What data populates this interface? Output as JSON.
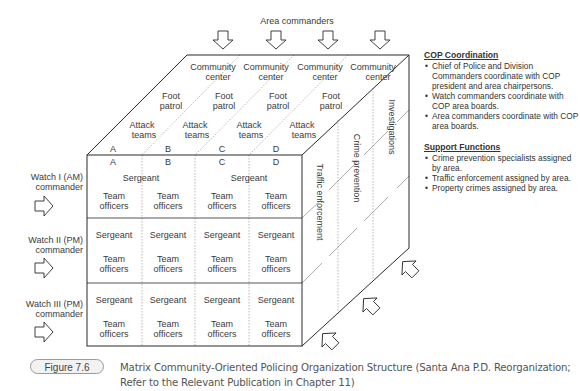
{
  "diagram": {
    "top_label": "Area commanders",
    "areas": [
      "A",
      "B",
      "C",
      "D"
    ],
    "top_face": {
      "rows": [
        {
          "line1": "Community",
          "line2": "center"
        },
        {
          "line1": "Foot",
          "line2": "patrol"
        },
        {
          "line1": "Attack",
          "line2": "teams"
        }
      ]
    },
    "front_face": {
      "row1": {
        "sergeant_label": "Sergeant",
        "cells": [
          {
            "line1": "Team",
            "line2": "officers"
          },
          {
            "line1": "Team",
            "line2": "officers"
          },
          {
            "line1": "Team",
            "line2": "officers"
          },
          {
            "line1": "Team",
            "line2": "officers"
          }
        ]
      },
      "row2": {
        "cells": [
          {
            "sergeant": "Sergeant",
            "line1": "Team",
            "line2": "officers"
          },
          {
            "sergeant": "Sergeant",
            "line1": "Team",
            "line2": "officers"
          },
          {
            "sergeant": "Sergeant",
            "line1": "Team",
            "line2": "officers"
          },
          {
            "sergeant": "Sergeant",
            "line1": "Team",
            "line2": "officers"
          }
        ]
      },
      "row3": {
        "cells": [
          {
            "sergeant": "Sergeant",
            "line1": "Team",
            "line2": "officers"
          },
          {
            "sergeant": "Sergeant",
            "line1": "Team",
            "line2": "officers"
          },
          {
            "sergeant": "Sergeant",
            "line1": "Team",
            "line2": "officers"
          },
          {
            "sergeant": "Sergeant",
            "line1": "Team",
            "line2": "officers"
          }
        ]
      }
    },
    "side_face": [
      "Traffic enforcement",
      "Crime prevention",
      "Investigations"
    ],
    "watches": [
      {
        "line1": "Watch I (AM)",
        "line2": "commander"
      },
      {
        "line1": "Watch II (PM)",
        "line2": "commander"
      },
      {
        "line1": "Watch III (PM)",
        "line2": "commander"
      }
    ]
  },
  "side_panel": {
    "sections": [
      {
        "title": "COP Coordination",
        "items": [
          "Chief of Police and Division Commanders coordinate with COP president and area chairpersons.",
          "Watch commanders coordinate with COP area boards.",
          "Area commanders coordinate with COP area boards."
        ]
      },
      {
        "title": "Support Functions",
        "items": [
          "Crime prevention specialists assigned by area.",
          "Traffic enforcement assigned by area.",
          "Property crimes assigned by area."
        ]
      }
    ]
  },
  "caption": {
    "figure_label": "Figure 7.6",
    "text": "Matrix Community-Oriented Policing Organization Structure (Santa Ana P.D. Reorganization; Refer to the Relevant Publication in Chapter 11)"
  },
  "colors": {
    "line": "#2a2a2a",
    "dotted": "#8a8a8a",
    "text": "#3a3a3a",
    "pill_bg": "#f2f2f2"
  }
}
